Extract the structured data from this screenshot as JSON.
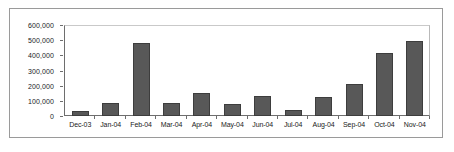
{
  "chart_data": {
    "type": "bar",
    "title": "",
    "xlabel": "",
    "ylabel": "",
    "grid": false,
    "legend": false,
    "ylim": [
      0,
      600000
    ],
    "ytick_labels": [
      "600,000",
      "500,000",
      "400,000",
      "300,000",
      "200,000",
      "100,000",
      "0"
    ],
    "ytick_values": [
      600000,
      500000,
      400000,
      300000,
      200000,
      100000,
      0
    ],
    "categories": [
      "Dec-03",
      "Jan-04",
      "Feb-04",
      "Mar-04",
      "Apr-04",
      "May-04",
      "Jun-04",
      "Jul-04",
      "Aug-04",
      "Sep-04",
      "Oct-04",
      "Nov-04"
    ],
    "values": [
      33000,
      87000,
      483000,
      85000,
      155000,
      80000,
      133000,
      40000,
      125000,
      213000,
      418000,
      493000
    ],
    "bar_color": "#585858",
    "bar_edge_color": "#3d3d3d",
    "axis_color": "#6e6e6e",
    "frame_color": "#9a9a9a",
    "background": "#ffffff"
  }
}
